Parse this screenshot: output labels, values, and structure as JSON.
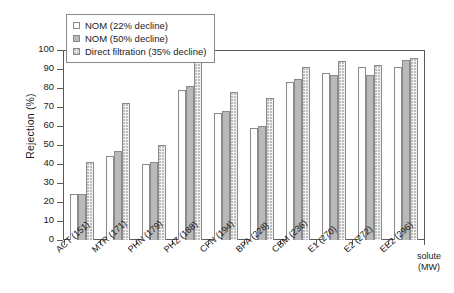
{
  "chart_data": {
    "type": "bar",
    "title": "",
    "xlabel": "solute (MW)",
    "ylabel": "Rejection (%)",
    "ylim": [
      0,
      100
    ],
    "ytick_step": 10,
    "yticks": [
      100,
      90,
      80,
      70,
      60,
      50,
      40,
      30,
      20,
      10,
      0
    ],
    "grid": false,
    "legend_position": "top-left",
    "categories": [
      "ACT (151)",
      "MTR (171)",
      "PHN (179)",
      "PHZ (188)",
      "CFN (194)",
      "BPA (228)",
      "CBM (236)",
      "E1 (270)",
      "E2 (272)",
      "EE2 (296)"
    ],
    "series": [
      {
        "name": "NOM (22% decline)",
        "values": [
          24,
          44,
          40,
          79,
          67,
          59,
          83,
          88,
          91,
          91
        ]
      },
      {
        "name": "NOM (50% decline)",
        "values": [
          24,
          47,
          41,
          81,
          68,
          60,
          85,
          87,
          87,
          95
        ]
      },
      {
        "name": "Direct filtration (35% decline)",
        "values": [
          41,
          72,
          50,
          95,
          78,
          75,
          91,
          94,
          92,
          96
        ]
      }
    ]
  },
  "legend": {
    "items": [
      {
        "label": "NOM (22% decline)"
      },
      {
        "label": "NOM (50% decline)"
      },
      {
        "label": "Direct filtration (35% decline)"
      }
    ]
  }
}
